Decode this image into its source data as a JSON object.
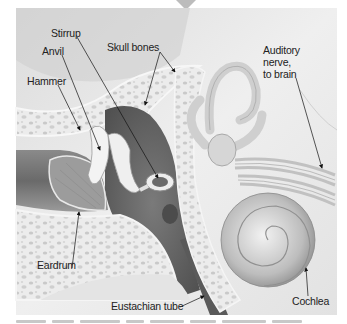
{
  "figure": {
    "labels": {
      "stirrup": "Stirrup",
      "anvil": "Anvil",
      "hammer": "Hammer",
      "skull_bones": "Skull bones",
      "auditory_nerve": "Auditory\nnerve,\nto brain",
      "eardrum": "Eardrum",
      "eustachian_tube": "Eustachian tube",
      "cochlea": "Cochlea"
    },
    "colors": {
      "background": "#ffffff",
      "skull_light": "#e6e6e6",
      "cavity_dark": "#6e6e6e",
      "bone_speckle": "#d2d2d2",
      "leader_line": "#111111"
    }
  }
}
